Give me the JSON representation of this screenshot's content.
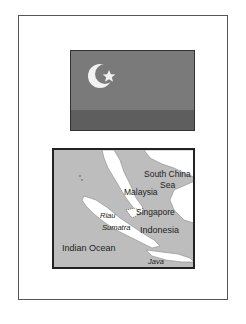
{
  "flag": {
    "icon": "crescent-star-icon",
    "colors": {
      "field": "#7a7a7a",
      "stripe": "#5e5e5e",
      "emblem": "#f2f2f2"
    }
  },
  "map": {
    "labels": {
      "south_china_sea_1": "South China",
      "south_china_sea_2": "Sea",
      "malaysia": "Malaysia",
      "singapore": "Singapore",
      "riau": "Riau",
      "sumatra": "Sumatra",
      "indonesia": "Indonesia",
      "indian_ocean": "Indian Ocean",
      "java": "Java"
    },
    "colors": {
      "water": "#bdbdbd",
      "land": "#ffffff"
    }
  }
}
